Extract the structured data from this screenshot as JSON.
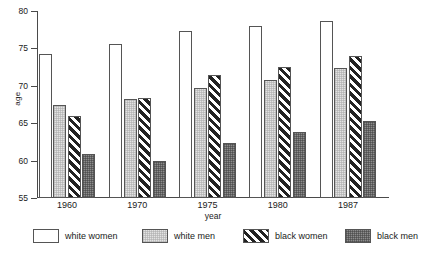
{
  "chart_data": {
    "type": "bar",
    "title": "",
    "xlabel": "year",
    "ylabel": "age",
    "categories": [
      "1960",
      "1970",
      "1975",
      "1980",
      "1987"
    ],
    "ylim": [
      55,
      80
    ],
    "yticks": [
      55,
      60,
      65,
      70,
      75,
      80
    ],
    "grid": false,
    "legend_position": "bottom",
    "series": [
      {
        "name": "white women",
        "values": [
          74.2,
          75.6,
          77.3,
          78.0,
          78.7
        ],
        "pattern": "white"
      },
      {
        "name": "white men",
        "values": [
          67.5,
          68.3,
          69.7,
          70.8,
          72.4
        ],
        "pattern": "light-gray-stipple"
      },
      {
        "name": "black women",
        "values": [
          66.0,
          68.4,
          71.5,
          72.5,
          74.0
        ],
        "pattern": "diagonal-hatch"
      },
      {
        "name": "black men",
        "values": [
          60.9,
          60.0,
          62.4,
          63.8,
          65.3
        ],
        "pattern": "dark-gray-stipple"
      }
    ]
  },
  "colors": {
    "axis": "#4a4a4a",
    "bar_outline": "#555555",
    "white_women": "#ffffff",
    "white_men": "#e3e3e3",
    "black_women": "#222222",
    "black_men": "#8d8d8d",
    "text": "#1a1a1a",
    "background": "#ffffff"
  }
}
